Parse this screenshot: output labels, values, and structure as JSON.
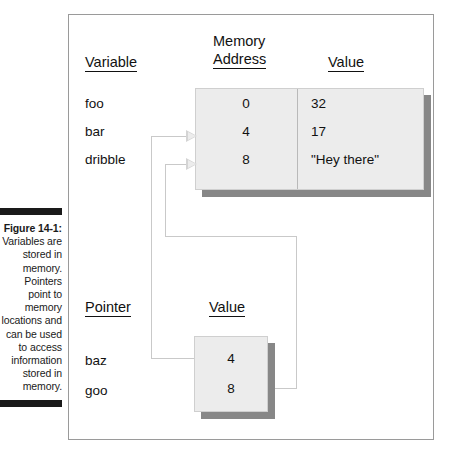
{
  "figure": {
    "number": "Figure 14-1:",
    "caption": "Variables are stored in memory. Pointers point to memory locations and can be used to access information stored in memory."
  },
  "headings": {
    "variable": "Variable",
    "memory_line1": "Memory",
    "memory_line2": "Address",
    "value": "Value",
    "pointer": "Pointer",
    "pointer_value": "Value"
  },
  "memory_table": {
    "variables": [
      "foo",
      "bar",
      "dribble"
    ],
    "addresses": [
      "0",
      "4",
      "8"
    ],
    "values": [
      "32",
      "17",
      "\"Hey there\""
    ]
  },
  "pointer_table": {
    "pointers": [
      "baz",
      "goo"
    ],
    "values": [
      "4",
      "8"
    ]
  },
  "colors": {
    "box_fill": "#ececec",
    "box_shadow": "#878787",
    "connector": "#c9c9c9",
    "frame_border": "#9a9a9a",
    "text": "#111111",
    "rule": "#1a1a1a"
  }
}
